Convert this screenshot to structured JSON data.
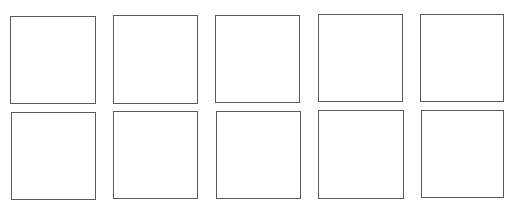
{
  "canvas": {
    "width": 514,
    "height": 209,
    "background": "#ffffff",
    "stroke_color": "#5a5a5a"
  },
  "grid": {
    "rows": 2,
    "columns": 5,
    "boxes": [
      {
        "row": 0,
        "col": 0,
        "x": 10,
        "y": 16,
        "w": 86,
        "h": 88
      },
      {
        "row": 0,
        "col": 1,
        "x": 113,
        "y": 15,
        "w": 85,
        "h": 89
      },
      {
        "row": 0,
        "col": 2,
        "x": 215,
        "y": 15,
        "w": 85,
        "h": 88
      },
      {
        "row": 0,
        "col": 3,
        "x": 318,
        "y": 14,
        "w": 85,
        "h": 88
      },
      {
        "row": 0,
        "col": 4,
        "x": 420,
        "y": 14,
        "w": 84,
        "h": 88
      },
      {
        "row": 1,
        "col": 0,
        "x": 11,
        "y": 112,
        "w": 85,
        "h": 88
      },
      {
        "row": 1,
        "col": 1,
        "x": 113,
        "y": 111,
        "w": 85,
        "h": 88
      },
      {
        "row": 1,
        "col": 2,
        "x": 216,
        "y": 111,
        "w": 85,
        "h": 88
      },
      {
        "row": 1,
        "col": 3,
        "x": 318,
        "y": 110,
        "w": 86,
        "h": 89
      },
      {
        "row": 1,
        "col": 4,
        "x": 421,
        "y": 110,
        "w": 83,
        "h": 88
      }
    ]
  }
}
